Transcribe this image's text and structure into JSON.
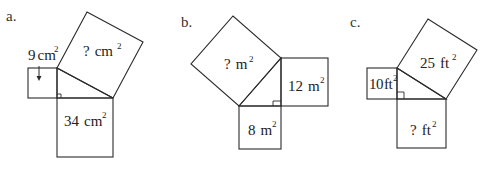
{
  "figures": [
    {
      "part_label": "a.",
      "squares": [
        {
          "position": "left",
          "value": "9",
          "unit": "cm",
          "exponent": "2"
        },
        {
          "position": "hypotenuse",
          "value": "?",
          "unit": "cm",
          "exponent": "2"
        },
        {
          "position": "bottom",
          "value": "34",
          "unit": "cm",
          "exponent": "2"
        }
      ]
    },
    {
      "part_label": "b.",
      "squares": [
        {
          "position": "hypotenuse",
          "value": "?",
          "unit": "m",
          "exponent": "2"
        },
        {
          "position": "right",
          "value": "12",
          "unit": "m",
          "exponent": "2"
        },
        {
          "position": "bottom",
          "value": "8",
          "unit": "m",
          "exponent": "2"
        }
      ]
    },
    {
      "part_label": "c.",
      "squares": [
        {
          "position": "hypotenuse",
          "value": "25",
          "unit": "ft",
          "exponent": "2"
        },
        {
          "position": "left",
          "value": "10",
          "unit": "ft",
          "exponent": "2"
        },
        {
          "position": "bottom",
          "value": "?",
          "unit": "ft",
          "exponent": "2"
        }
      ]
    }
  ],
  "colors": {
    "stroke": "#2a2a2a",
    "text": "#222222",
    "background": "#ffffff"
  }
}
